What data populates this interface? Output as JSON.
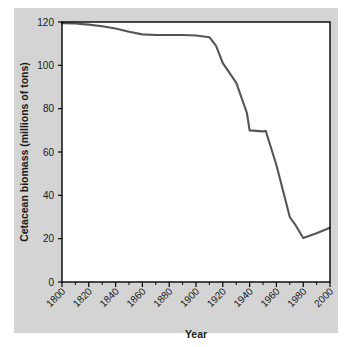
{
  "figure": {
    "background_color": "#d4d4d4",
    "plot_background_color": "#ffffff",
    "frame_color": "#000000",
    "line_color": "#555555"
  },
  "chart_data": {
    "type": "line",
    "title": "",
    "xlabel": "Year",
    "ylabel": "Cetacean biomass (millions of tons)",
    "xlim": [
      1800,
      2000
    ],
    "ylim": [
      0,
      120
    ],
    "xticks": [
      1800,
      1820,
      1840,
      1860,
      1880,
      1900,
      1920,
      1940,
      1960,
      1980,
      2000
    ],
    "xtick_labels": [
      "1800",
      "1820",
      "1840",
      "1860",
      "1880",
      "1900",
      "1920",
      "1940",
      "1960",
      "1980",
      "2000"
    ],
    "yticks": [
      0,
      20,
      40,
      60,
      80,
      100,
      120
    ],
    "ytick_labels": [
      "0",
      "20",
      "40",
      "60",
      "80",
      "100",
      "120"
    ],
    "xtick_label_rotation": 45,
    "minor_xticks_per_interval": 1,
    "grid": false,
    "legend": false,
    "series": [
      {
        "name": "Cetacean biomass",
        "x": [
          1800,
          1810,
          1820,
          1830,
          1840,
          1850,
          1860,
          1870,
          1880,
          1890,
          1900,
          1910,
          1915,
          1920,
          1930,
          1938,
          1940,
          1950,
          1952,
          1960,
          1970,
          1974,
          1980,
          1990,
          2000
        ],
        "y": [
          119.5,
          119.3,
          118.8,
          118.0,
          117.0,
          115.5,
          114.3,
          114.0,
          114.0,
          114.0,
          113.8,
          113.0,
          109.0,
          101.0,
          92.0,
          78.0,
          70.0,
          69.5,
          69.8,
          54.0,
          30.0,
          26.5,
          20.3,
          22.5,
          25.0
        ]
      }
    ]
  },
  "axis_labels": {
    "y_axis_title": "Cetacean biomass (millions of tons)",
    "x_axis_title": "Year"
  }
}
